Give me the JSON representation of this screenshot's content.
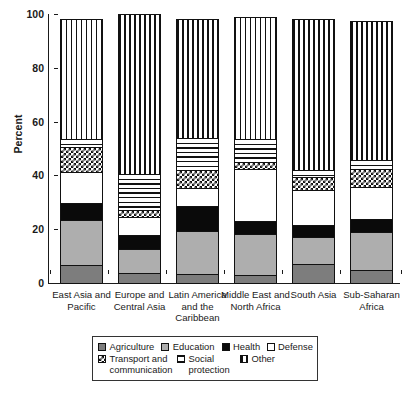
{
  "chart_data": {
    "type": "bar",
    "subtype": "stacked-bar-100",
    "title": "",
    "xlabel": "",
    "ylabel": "Percent",
    "ylim": [
      0,
      100
    ],
    "yticks": [
      0,
      20,
      40,
      60,
      80,
      100
    ],
    "ytick_labels": [
      "0",
      "20",
      "40",
      "60",
      "80",
      "100"
    ],
    "grid": false,
    "legend_position": "bottom",
    "categories": [
      "East Asia and\nPacific",
      "Europe and\nCentral Asia",
      "Latin America\nand\nthe Caribbean",
      "Middle East\nand\nNorth Africa",
      "South Asia",
      "Sub-Saharan\nAfrica"
    ],
    "series": [
      {
        "name": "Agriculture",
        "pattern": "solid-dark-gray",
        "color": "#7d7d7d",
        "values": [
          6.5,
          3.8,
          3.2,
          2.8,
          7.0,
          4.8
        ]
      },
      {
        "name": "Education",
        "pattern": "solid-light-gray",
        "color": "#aeaeae",
        "values": [
          16.8,
          8.7,
          16.3,
          15.5,
          10.2,
          14.3
        ]
      },
      {
        "name": "Health",
        "pattern": "solid-black",
        "color": "#0a0a0a",
        "values": [
          6.6,
          5.2,
          9.3,
          4.9,
          4.3,
          4.8
        ]
      },
      {
        "name": "Defense",
        "pattern": "white",
        "color": "#ffffff",
        "values": [
          11.4,
          6.9,
          6.7,
          19.1,
          12.9,
          11.6
        ]
      },
      {
        "name": "Transport and communication",
        "pattern": "checkered",
        "color": "#ffffff",
        "values": [
          9.4,
          2.4,
          6.5,
          2.6,
          4.9,
          6.9
        ]
      },
      {
        "name": "Social protection",
        "pattern": "horizontal-lines",
        "color": "#ffffff",
        "values": [
          3.1,
          13.8,
          12.4,
          9.1,
          3.2,
          3.8
        ]
      },
      {
        "name": "Other",
        "pattern": "vertical-lines",
        "color": "#ffffff",
        "values": [
          44.2,
          59.2,
          43.6,
          45.0,
          55.5,
          51.3
        ]
      }
    ],
    "bar_totals": [
      98.0,
      100.0,
      98.0,
      99.0,
      98.0,
      97.5
    ]
  },
  "axis": {
    "y_title": "Percent",
    "y_ticks": [
      "100",
      "80",
      "60",
      "40",
      "20",
      "0"
    ]
  },
  "legend": {
    "row1": [
      {
        "label": "Agriculture",
        "swatch": "agriculture-swatch"
      },
      {
        "label": "Education",
        "swatch": "education-swatch"
      },
      {
        "label": "Health",
        "swatch": "health-swatch"
      },
      {
        "label": "Defense",
        "swatch": "defense-swatch"
      }
    ],
    "row2": [
      {
        "label": "Transport and\ncommunication",
        "swatch": "transport-swatch"
      },
      {
        "label": "Social\nprotection",
        "swatch": "social-protection-swatch"
      },
      {
        "label": "Other",
        "swatch": "other-swatch"
      }
    ]
  }
}
